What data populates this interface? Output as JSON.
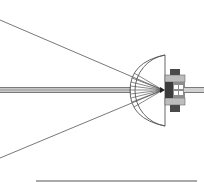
{
  "diagram": {
    "colors": {
      "background": "#ffffff",
      "line": "#555555",
      "rod_light": "#c8c8c8",
      "rod_dark": "#8a8a8a",
      "holder_dark": "#4a4a4a",
      "holder_mid": "#8c8c8c",
      "holder_light": "#bdbdbd"
    },
    "rays": [
      {
        "name": "upper-ray",
        "x1": 0,
        "y1": 20,
        "x2": 163,
        "y2": 90
      },
      {
        "name": "lower-ray",
        "x1": 0,
        "y1": 158,
        "x2": 163,
        "y2": 90
      }
    ],
    "lens": {
      "flat_x": 165,
      "top_y": 55,
      "bottom_y": 126,
      "apex_x": 130,
      "focal_x": 163,
      "focal_y": 90,
      "fan_lines": 9
    },
    "rod": {
      "x1": 0,
      "x2": 131,
      "y": 90,
      "thickness": 6
    },
    "shaft": {
      "x1": 184,
      "x2": 204,
      "y": 90,
      "thickness": 6
    },
    "scale_bar": {
      "x1": 36,
      "x2": 197,
      "y": 181
    }
  }
}
